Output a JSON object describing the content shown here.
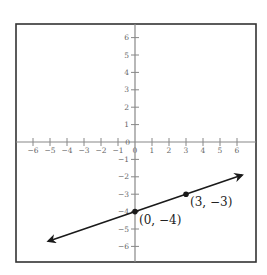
{
  "chart_data": {
    "type": "line",
    "title": "",
    "xlabel": "",
    "ylabel": "",
    "xlim": [
      -6,
      6
    ],
    "ylim": [
      -6,
      6
    ],
    "grid": false,
    "x_ticks": [
      -6,
      -5,
      -4,
      -3,
      -2,
      -1,
      0,
      1,
      2,
      3,
      4,
      5,
      6
    ],
    "y_ticks": [
      -6,
      -5,
      -4,
      -3,
      -2,
      -1,
      1,
      2,
      3,
      4,
      5,
      6
    ],
    "x_tick_labels": [
      "−6",
      "−5",
      "−4",
      "−3",
      "−2",
      "−1",
      "0",
      "1",
      "2",
      "3",
      "4",
      "5",
      "6"
    ],
    "y_tick_labels": [
      "6",
      "5",
      "4",
      "3",
      "2",
      "1",
      "0",
      "−1",
      "−2",
      "−3",
      "−4",
      "−5",
      "−6"
    ],
    "series": [
      {
        "name": "line",
        "slope": 0.3333,
        "intercept": -4,
        "arrows_both_ends": true,
        "x": [
          -5.1,
          6.3
        ],
        "y": [
          -5.7,
          -1.9
        ]
      }
    ],
    "points": [
      {
        "x": 0,
        "y": -4,
        "label": "(0, −4)"
      },
      {
        "x": 3,
        "y": -3,
        "label": "(3, −3)"
      }
    ],
    "colors": {
      "axis": "#888888",
      "frame": "#333333",
      "line": "#1a1a1a",
      "tick_label": "#666666"
    }
  }
}
